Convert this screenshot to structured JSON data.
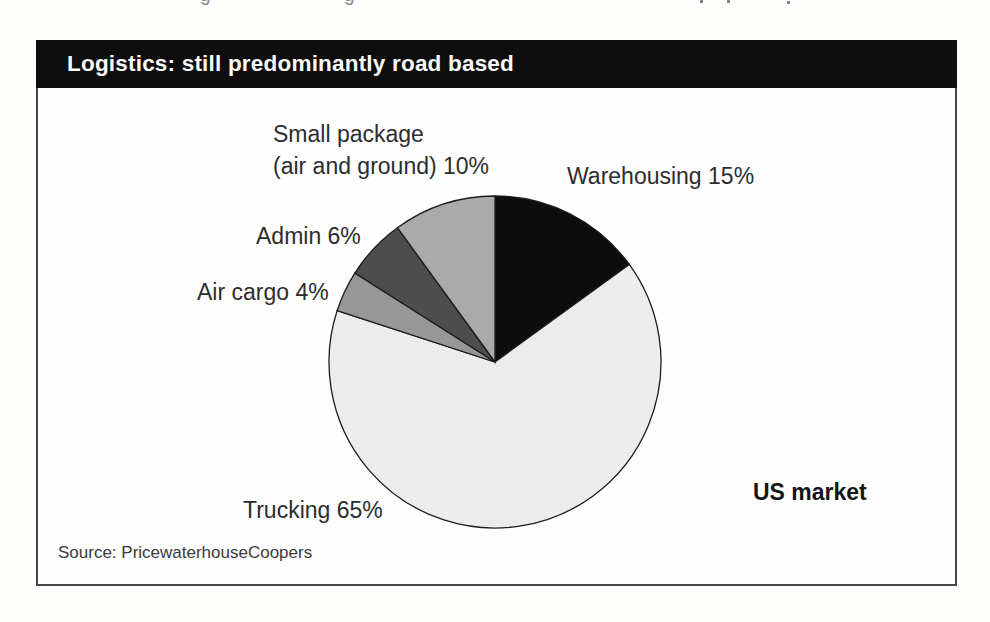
{
  "figure": {
    "title": "Logistics: still predominantly road based",
    "region_label": "US market",
    "source": "Source: PricewaterhouseCoopers"
  },
  "chart_data": {
    "type": "pie",
    "title": "Logistics: still predominantly road based",
    "unit": "%",
    "start_angle_deg": 0,
    "direction": "clockwise",
    "legend": "none",
    "slices": [
      {
        "id": "warehousing",
        "label": "Warehousing",
        "value": 15,
        "color": "#0d0d0d",
        "display": "Warehousing 15%"
      },
      {
        "id": "trucking",
        "label": "Trucking",
        "value": 65,
        "color": "#ececec",
        "display": "Trucking 65%"
      },
      {
        "id": "air-cargo",
        "label": "Air cargo",
        "value": 4,
        "color": "#979797",
        "display": "Air cargo 4%"
      },
      {
        "id": "admin",
        "label": "Admin",
        "value": 6,
        "color": "#4d4d4d",
        "display": "Admin 6%"
      },
      {
        "id": "small-package",
        "label": "Small package (air and ground)",
        "value": 10,
        "color": "#aaaaaa",
        "display_line1": "Small package",
        "display_line2": "(air and ground) 10%"
      }
    ],
    "annotations": [
      "US market"
    ],
    "slice_outline_color": "#1c1c1c"
  },
  "artifacts": {
    "top_edge_fragments": [
      "g",
      "g"
    ]
  }
}
